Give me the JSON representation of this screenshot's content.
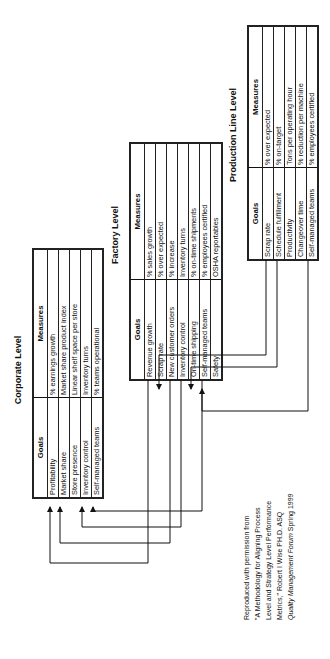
{
  "corporate": {
    "title": "Corporate Level",
    "headers": {
      "goals": "Goals",
      "measures": "Measures"
    },
    "rows": [
      {
        "goal": "Profitability",
        "measure": "% earnings growth"
      },
      {
        "goal": "Market share",
        "measure": "Market share product index"
      },
      {
        "goal": "Store presence",
        "measure": "Linear shelf space per store"
      },
      {
        "goal": "Inventory control",
        "measure": "Inventory turns"
      },
      {
        "goal": "Self-managed teams",
        "measure": "% teams operational"
      }
    ]
  },
  "factory": {
    "title": "Factory Level",
    "headers": {
      "goals": "Goals",
      "measures": "Measures"
    },
    "rows": [
      {
        "goal": "Revenue growth",
        "measure": "% sales growth"
      },
      {
        "goal": "Scrap rate",
        "measure": "% over expected"
      },
      {
        "goal": "New customer orders",
        "measure": "% increase"
      },
      {
        "goal": "Inventory control",
        "measure": "Inventory turns"
      },
      {
        "goal": "On-time shipping",
        "measure": "% on-time shipments"
      },
      {
        "goal": "Self-managed teams",
        "measure": "% employees certified"
      },
      {
        "goal": "Safety",
        "measure": "OSHA reportables"
      }
    ]
  },
  "production": {
    "title": "Production Line Level",
    "headers": {
      "goals": "Goals",
      "measures": "Measures"
    },
    "rows": [
      {
        "goal": "Scrap rate",
        "measure": "% over expected"
      },
      {
        "goal": "Schedule fulfillment",
        "measure": "% on-target"
      },
      {
        "goal": "Productivity",
        "measure": "Tons per operating hour"
      },
      {
        "goal": "Changeover time",
        "measure": "% reduction per machine"
      },
      {
        "goal": "Self-managed teams",
        "measure": "% employees certified"
      }
    ]
  },
  "links": [
    {
      "from": "factory.Revenue growth",
      "to": "corporate.Profitability"
    },
    {
      "from": "factory.New customer orders",
      "to": "corporate.Market share"
    },
    {
      "from": "factory.Inventory control",
      "to": "corporate.Inventory control"
    },
    {
      "from": "factory.Self-managed teams",
      "to": "corporate.Self-managed teams"
    },
    {
      "from": "production.Scrap rate",
      "to": "factory.Scrap rate"
    },
    {
      "from": "production.Schedule fulfillment",
      "to": "factory.On-time shipping"
    },
    {
      "from": "production.Self-managed teams",
      "to": "factory.Self-managed teams"
    }
  ],
  "citation": {
    "line1": "Reproduced with permission from",
    "line2": "\"A Methodology for Aligning Process",
    "line3": "Level and Strategy Level Performance",
    "line4": "Metrics,\" Robert I Wise PH.D. ASQ",
    "line5_italic": "Quality Management Forum",
    "line5_rest": " Spring 1999"
  },
  "colors": {
    "line": "#111111",
    "background": "#ffffff"
  }
}
